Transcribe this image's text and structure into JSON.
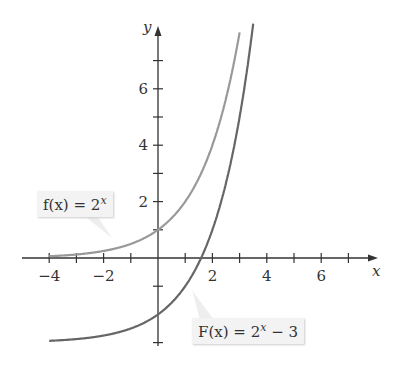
{
  "chart_data": {
    "type": "line",
    "title": "",
    "xlabel": "x",
    "ylabel": "y",
    "xlim": [
      -4.9,
      8
    ],
    "ylim": [
      -3.5,
      8.5
    ],
    "x_ticks": [
      -4,
      -3,
      -2,
      -1,
      1,
      2,
      3,
      4,
      5,
      6,
      7
    ],
    "x_tick_labels": [
      "-4",
      "-2",
      "2",
      "4",
      "6"
    ],
    "y_ticks": [
      -3,
      -1,
      1,
      2,
      3,
      4,
      5,
      6,
      7
    ],
    "y_tick_labels": [
      "2",
      "4",
      "6"
    ],
    "series": [
      {
        "name": "f(x) = 2^x",
        "expression": "2^x",
        "color": "#999999",
        "x_range": [
          -4,
          3.0
        ]
      },
      {
        "name": "F(x) = 2^x - 3",
        "expression": "2^x - 3",
        "color": "#666666",
        "x_range": [
          -4,
          3.5
        ]
      }
    ],
    "annotations": [
      {
        "text": "f(x) = 2^x",
        "points_to": [
          -2,
          0.25
        ]
      },
      {
        "text": "F(x) = 2^x - 3",
        "points_to": [
          1,
          -1
        ]
      }
    ]
  },
  "labels": {
    "f_name": "f(x) = 2",
    "f_exp": "x",
    "F_name": "F(x) = 2",
    "F_exp": "x",
    "F_tail": " − 3",
    "x_axis": "x",
    "y_axis": "y"
  }
}
